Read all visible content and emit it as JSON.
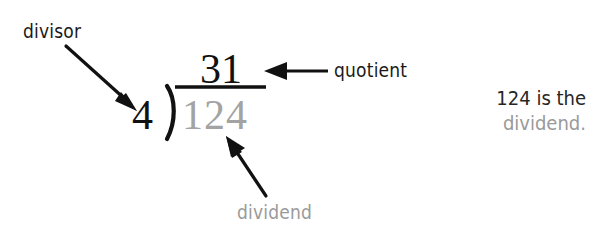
{
  "figure": {
    "background_color": "#ffffff"
  },
  "colors": {
    "ink_black": "#111111",
    "label_black": "#1a1a1a",
    "gray": "#9a9a9a",
    "numeral_gray": "#a3a3a3"
  },
  "math": {
    "divisor": "4",
    "bracket": ")",
    "dividend": "124",
    "quotient": "31"
  },
  "labels": {
    "divisor": "divisor",
    "quotient": "quotient",
    "dividend": "dividend"
  },
  "sidenote": {
    "line1": "124 is the",
    "line2": "dividend."
  },
  "arrows": {
    "divisor_arrow": "arrow pointing down-right to the divisor 4",
    "quotient_arrow": "arrow pointing left to the quotient 31",
    "dividend_arrow": "arrow pointing up-left to the dividend 124"
  }
}
